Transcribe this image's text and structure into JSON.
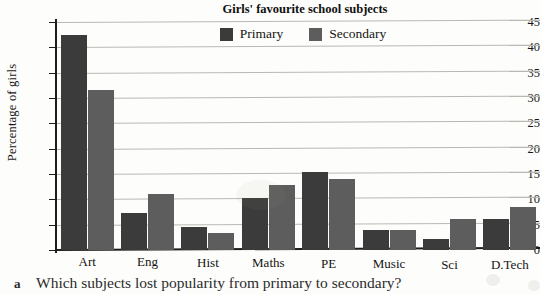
{
  "chart_data": {
    "type": "bar",
    "title": "Girls' favourite school subjects",
    "xlabel": "",
    "ylabel": "Percentage of girls",
    "ylim": [
      0,
      45
    ],
    "ytick_step": 5,
    "yticks": [
      0,
      5,
      10,
      15,
      20,
      25,
      30,
      35,
      40,
      45
    ],
    "grid": true,
    "legend_position": "top-center",
    "categories": [
      "Art",
      "Eng",
      "Hist",
      "Maths",
      "PE",
      "Music",
      "Sci",
      "D.Tech"
    ],
    "series": [
      {
        "name": "Primary",
        "color": "#3b3b3b",
        "values": [
          42.5,
          7.4,
          4.5,
          10.3,
          15.3,
          3.9,
          2.1,
          6.1
        ]
      },
      {
        "name": "Secondary",
        "color": "#5d5d5d",
        "values": [
          31.5,
          11.1,
          3.4,
          12.8,
          14.0,
          3.9,
          6.2,
          8.5
        ]
      }
    ]
  },
  "caption": {
    "marker": "a",
    "text": "Which subjects lost popularity from primary to secondary?"
  },
  "colors": {
    "primary_bar": "#3b3b3b",
    "secondary_bar": "#5d5d5d",
    "gridline": "#b9b9b4",
    "axis": "#1d1d1d",
    "page_background": "#fdfdfb"
  }
}
